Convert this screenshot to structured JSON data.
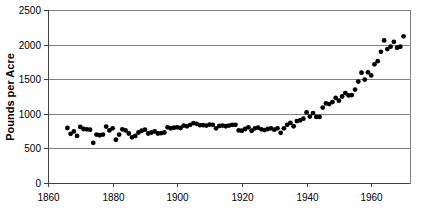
{
  "chart_data": {
    "type": "scatter",
    "title": "",
    "subtitle": "",
    "xlabel": "",
    "ylabel": "Pounds per Acre",
    "xlim": [
      1860,
      1972
    ],
    "ylim": [
      0,
      2500
    ],
    "xticks": [
      1860,
      1880,
      1900,
      1920,
      1940,
      1960
    ],
    "yticks": [
      0,
      500,
      1000,
      1500,
      2000,
      2500
    ],
    "xtick_labels": [
      "1860",
      "1880",
      "1900",
      "1920",
      "1940",
      "1960"
    ],
    "ytick_labels": [
      "0",
      "500",
      "1000",
      "1500",
      "2000",
      "2500"
    ],
    "grid": "horizontal",
    "legend": "none",
    "marker": "filled-circle",
    "marker_color": "#000000",
    "marker_size": 3,
    "series": [
      {
        "name": "Yield",
        "x": [
          1866,
          1867,
          1868,
          1869,
          1870,
          1871,
          1872,
          1873,
          1874,
          1875,
          1876,
          1877,
          1878,
          1879,
          1880,
          1881,
          1882,
          1883,
          1884,
          1885,
          1886,
          1887,
          1888,
          1889,
          1890,
          1891,
          1892,
          1893,
          1894,
          1895,
          1896,
          1897,
          1898,
          1899,
          1900,
          1901,
          1902,
          1903,
          1904,
          1905,
          1906,
          1907,
          1908,
          1909,
          1910,
          1911,
          1912,
          1913,
          1914,
          1915,
          1916,
          1917,
          1918,
          1919,
          1920,
          1921,
          1922,
          1923,
          1924,
          1925,
          1926,
          1927,
          1928,
          1929,
          1930,
          1931,
          1932,
          1933,
          1934,
          1935,
          1936,
          1937,
          1938,
          1939,
          1940,
          1941,
          1942,
          1943,
          1944,
          1945,
          1946,
          1947,
          1948,
          1949,
          1950,
          1951,
          1952,
          1953,
          1954,
          1955,
          1956,
          1957,
          1958,
          1959,
          1960,
          1961,
          1962,
          1963,
          1964,
          1965,
          1966,
          1967,
          1968,
          1969,
          1970
        ],
        "y": [
          795,
          710,
          745,
          680,
          810,
          780,
          775,
          770,
          580,
          700,
          690,
          700,
          815,
          760,
          790,
          625,
          700,
          775,
          760,
          715,
          660,
          680,
          730,
          755,
          770,
          715,
          730,
          745,
          715,
          720,
          730,
          805,
          790,
          800,
          805,
          795,
          830,
          820,
          840,
          865,
          855,
          835,
          835,
          830,
          845,
          840,
          790,
          825,
          830,
          820,
          830,
          840,
          840,
          760,
          755,
          780,
          805,
          755,
          790,
          800,
          775,
          765,
          780,
          790,
          770,
          790,
          725,
          790,
          840,
          870,
          820,
          895,
          905,
          930,
          1020,
          960,
          1010,
          955,
          955,
          1090,
          1150,
          1140,
          1170,
          1230,
          1190,
          1250,
          1300,
          1265,
          1270,
          1350,
          1465,
          1595,
          1495,
          1600,
          1555,
          1715,
          1760,
          1895,
          2060,
          1935,
          1970,
          2040,
          1955,
          1970,
          2120
        ]
      }
    ]
  },
  "axis": {
    "y_title": "Pounds per Acre"
  }
}
